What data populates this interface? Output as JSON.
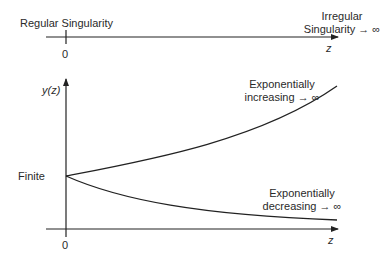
{
  "top_axis": {
    "left_label": "Regular Singularity",
    "origin_label": "0",
    "right_label_line1": "Irregular",
    "right_label_line2": "Singularity → ∞",
    "axis_label": "z"
  },
  "plot": {
    "y_axis_label": "y(z)",
    "x_axis_label": "z",
    "origin_label": "0",
    "start_label": "Finite",
    "increasing_label_line1": "Exponentially",
    "increasing_label_line2": "increasing → ∞",
    "decreasing_label_line1": "Exponentially",
    "decreasing_label_line2": "decreasing → ∞"
  },
  "colors": {
    "line": "#222222",
    "background": "#ffffff"
  }
}
